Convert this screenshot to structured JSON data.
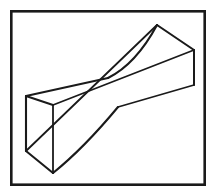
{
  "figure": {
    "title": "Twisted prismatic solid line drawing",
    "type": "line-art-3d-solid",
    "canvas": {
      "width": 216,
      "height": 196
    },
    "background_color": "#ffffff",
    "line_color": "#1a1a1a",
    "fill_color": "#ffffff",
    "frame": {
      "name": "border-frame",
      "x": 10,
      "y": 10,
      "width": 196,
      "height": 176,
      "stroke_width": 2.6,
      "color": "#1a1a1a"
    },
    "geometry": {
      "description": "A twisted beam (hyperbolic paraboloid ruled surface) with rectangular prism end caps, lower-left end and upper-right end, edges crossing near the center",
      "left_cap": {
        "name": "left-end-cap",
        "back_top": [
          26,
          96
        ],
        "front_top": [
          53,
          105
        ],
        "back_bottom": [
          26,
          151
        ],
        "front_bottom": [
          53,
          173
        ]
      },
      "right_cap": {
        "name": "right-end-cap",
        "apex_top": [
          157,
          25
        ],
        "right_top": [
          194,
          50
        ],
        "right_bottom": [
          194,
          85
        ]
      },
      "crossing_nodes": {
        "upper": [
          108,
          78
        ],
        "lower": [
          118,
          107
        ]
      },
      "edges": [
        {
          "name": "left-cap-top-edge",
          "from": [
            26,
            96
          ],
          "to": [
            53,
            105
          ],
          "kind": "straight"
        },
        {
          "name": "left-cap-back-vertical",
          "from": [
            26,
            96
          ],
          "to": [
            26,
            151
          ],
          "kind": "straight"
        },
        {
          "name": "left-cap-front-vertical",
          "from": [
            53,
            105
          ],
          "to": [
            53,
            173
          ],
          "kind": "straight"
        },
        {
          "name": "left-cap-bottom-edge",
          "from": [
            26,
            151
          ],
          "to": [
            53,
            173
          ],
          "kind": "straight"
        },
        {
          "name": "upper-ruled-edge-back",
          "from": [
            26,
            96
          ],
          "to": [
            108,
            78
          ],
          "kind": "straight"
        },
        {
          "name": "upper-curved-edge",
          "from": [
            108,
            78
          ],
          "to": [
            157,
            25
          ],
          "kind": "curve"
        },
        {
          "name": "top-surface-long-edge",
          "from": [
            53,
            105
          ],
          "to": [
            194,
            50
          ],
          "kind": "straight"
        },
        {
          "name": "right-cap-top-edge",
          "from": [
            157,
            25
          ],
          "to": [
            194,
            50
          ],
          "kind": "straight"
        },
        {
          "name": "right-cap-vertical",
          "from": [
            194,
            50
          ],
          "to": [
            194,
            85
          ],
          "kind": "straight"
        },
        {
          "name": "lower-ruled-edge-right",
          "from": [
            194,
            85
          ],
          "to": [
            118,
            107
          ],
          "kind": "straight"
        },
        {
          "name": "lower-curved-edge",
          "from": [
            118,
            107
          ],
          "to": [
            53,
            173
          ],
          "kind": "curve"
        },
        {
          "name": "bottom-twist-edge",
          "from": [
            26,
            151
          ],
          "to": [
            157,
            25
          ],
          "kind": "straight-partial"
        }
      ]
    }
  }
}
